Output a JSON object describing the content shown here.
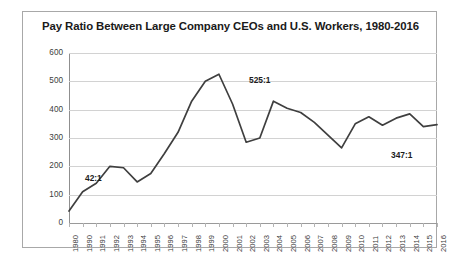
{
  "chart_data": {
    "type": "line",
    "title": "Pay Ratio Between Large Company CEOs and U.S. Workers, 1980-2016",
    "xlabel": "",
    "ylabel": "",
    "ylim": [
      0,
      600
    ],
    "ytick_step": 100,
    "yticks": [
      "600",
      "500",
      "400",
      "300",
      "200",
      "100",
      "0"
    ],
    "grid": true,
    "legend": false,
    "line_color": "#3f3f3f",
    "categories": [
      "1980",
      "1990",
      "1991",
      "1992",
      "1993",
      "1994",
      "1995",
      "1996",
      "1997",
      "1998",
      "1999",
      "2000",
      "2001",
      "2002",
      "2003",
      "2004",
      "2005",
      "2006",
      "2007",
      "2008",
      "2009",
      "2010",
      "2011",
      "2012",
      "2013",
      "2014",
      "2015",
      "2016"
    ],
    "values": [
      42,
      110,
      140,
      200,
      195,
      145,
      175,
      245,
      320,
      430,
      500,
      525,
      420,
      285,
      300,
      430,
      405,
      390,
      355,
      310,
      265,
      350,
      375,
      345,
      370,
      385,
      340,
      347
    ],
    "annotations": [
      {
        "text": "42:1",
        "category": "1980",
        "value": 42,
        "x_px": 16,
        "y_px": 120
      },
      {
        "text": "525:1",
        "category": "2000",
        "value": 525,
        "x_px": 180,
        "y_px": 22
      },
      {
        "text": "347:1",
        "category": "2016",
        "value": 347,
        "x_px": 322,
        "y_px": 97
      }
    ]
  }
}
